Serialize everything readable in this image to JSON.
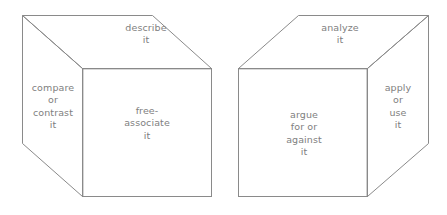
{
  "figure": {
    "title": "",
    "background_color": "#ffffff",
    "line_color": "#8a8a8a",
    "text_color": "#808080"
  },
  "cubes": [
    {
      "id": "left-cube",
      "name": "left-cube",
      "faces": {
        "top": {
          "name": "describe-it-face",
          "label": "describe\nit"
        },
        "side": {
          "name": "compare-or-contrast-it-face",
          "label": "compare\nor\ncontrast\nit"
        },
        "front": {
          "name": "free-associate-it-face",
          "label": "free-\nassociate\nit"
        }
      }
    },
    {
      "id": "right-cube",
      "name": "right-cube",
      "faces": {
        "top": {
          "name": "analyze-it-face",
          "label": "analyze\nit"
        },
        "front": {
          "name": "argue-for-or-against-it-face",
          "label": "argue\nfor or\nagainst\nit"
        },
        "side": {
          "name": "apply-or-use-it-face",
          "label": "apply\nor\nuse\nit"
        }
      }
    }
  ]
}
